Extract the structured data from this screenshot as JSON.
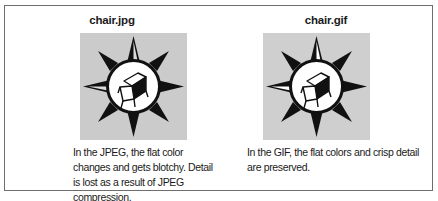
{
  "figures": [
    {
      "id": "jpg",
      "title": "chair.jpg",
      "image_label": "chair-compass-icon",
      "caption": "In the JPEG, the flat color changes and gets blotchy. Detail is lost as a result of JPEG compression."
    },
    {
      "id": "gif",
      "title": "chair.gif",
      "image_label": "chair-compass-icon",
      "caption": "In the GIF, the flat colors and crisp detail are preserved."
    }
  ],
  "colors": {
    "border": "#6e6e6e",
    "image_background": "#cfcfcf",
    "star": "#111111",
    "circle_fill": "#ffffff"
  }
}
